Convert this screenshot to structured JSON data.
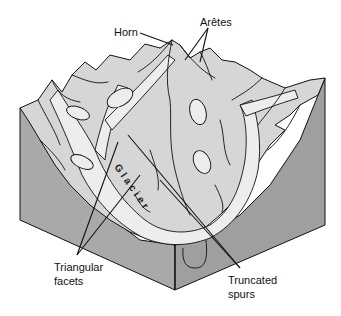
{
  "figure": {
    "colors": {
      "side_face": "#a9a9a9",
      "side_face_dark": "#9a9a9a",
      "mountain_fill": "#d6d6d6",
      "glacier_fill": "#eeeeee",
      "ink": "#111111",
      "background": "#ffffff"
    }
  },
  "labels": {
    "horn": "Horn",
    "aretes": "Arêtes",
    "glacier": "Glacier",
    "triangular_facets_line1": "Triangular",
    "triangular_facets_line2": "facets",
    "truncated_spurs_line1": "Truncated",
    "truncated_spurs_line2": "spurs"
  }
}
